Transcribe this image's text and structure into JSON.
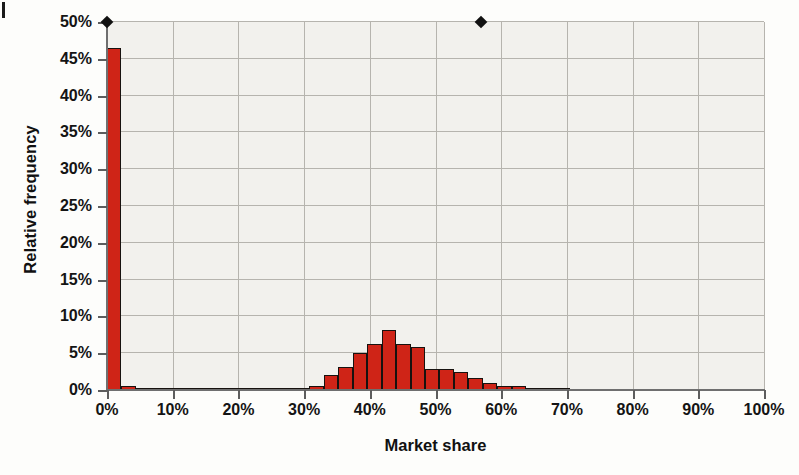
{
  "figure": {
    "corner_marker": "tab-mark"
  },
  "axes": {
    "xlabel": "Market share",
    "ylabel": "Relative frequency",
    "x_ticks": [
      "0%",
      "10%",
      "20%",
      "30%",
      "40%",
      "50%",
      "60%",
      "70%",
      "80%",
      "90%",
      "100%"
    ],
    "y_ticks": [
      "0%",
      "5%",
      "10%",
      "15%",
      "20%",
      "25%",
      "30%",
      "35%",
      "40%",
      "45%",
      "50%"
    ]
  },
  "style": {
    "bar_fill": "#cf2417",
    "bar_stroke": "#17120f",
    "plot_bg": "#f2f1ed",
    "grid_color": "#b6b4ae",
    "axis_color": "#6f6f6f",
    "marker_color": "#111111"
  },
  "chart_data": {
    "type": "bar",
    "title": "",
    "subtitle": "",
    "xlabel": "Market share",
    "ylabel": "Relative frequency",
    "xlim": [
      0,
      100
    ],
    "ylim": [
      0,
      50
    ],
    "xtick_values": [
      0,
      10,
      20,
      30,
      40,
      50,
      60,
      70,
      80,
      90,
      100
    ],
    "ytick_values": [
      0,
      5,
      10,
      15,
      20,
      25,
      30,
      35,
      40,
      45,
      50
    ],
    "grid": true,
    "legend": null,
    "bin_width": 2.2,
    "x_unit": "percent",
    "y_unit": "percent",
    "bin_starts": [
      0.0,
      2.2,
      4.4,
      6.6,
      8.8,
      11.0,
      13.2,
      15.4,
      17.6,
      19.8,
      22.0,
      24.2,
      26.4,
      28.6,
      30.8,
      33.0,
      35.2,
      37.4,
      39.6,
      41.8,
      44.0,
      46.2,
      48.4,
      50.6,
      52.8,
      55.0,
      57.2,
      59.4,
      61.6,
      63.8,
      66.0,
      68.2
    ],
    "values": [
      46.5,
      0.6,
      0.3,
      0.3,
      0.3,
      0.3,
      0.3,
      0.2,
      0.2,
      0.2,
      0.3,
      0.2,
      0.2,
      0.2,
      0.6,
      2.0,
      3.1,
      5.0,
      6.3,
      8.2,
      6.2,
      5.8,
      2.9,
      2.9,
      2.4,
      1.6,
      0.9,
      0.6,
      0.6,
      0.2,
      0.1,
      0.1
    ],
    "annotations": [
      {
        "name": "diamond-marker-left",
        "x": 0,
        "y": 50
      },
      {
        "name": "diamond-marker-right",
        "x": 57,
        "y": 50
      }
    ]
  }
}
